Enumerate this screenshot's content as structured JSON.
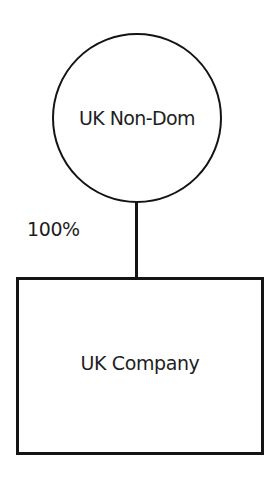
{
  "diagram": {
    "type": "ownership-structure",
    "nodes": [
      {
        "id": "owner",
        "shape": "circle",
        "label": "UK Non-Dom"
      },
      {
        "id": "company",
        "shape": "rectangle",
        "label": "UK Company"
      }
    ],
    "edges": [
      {
        "from": "owner",
        "to": "company",
        "label": "100%"
      }
    ]
  },
  "colors": {
    "stroke": "#141414",
    "text": "#1e1e1e",
    "background": "#ffffff"
  }
}
